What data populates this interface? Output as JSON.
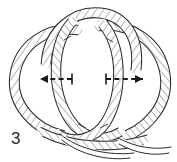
{
  "figure": {
    "kind": "line-drawing-illustration",
    "step_number": "3",
    "background_color": "#ffffff",
    "ink_color": "#2b2b2b",
    "rope_fill_color": "#ffffff",
    "rope_hatch_color": "#6f6f6f",
    "canvas": {
      "width": 177,
      "height": 162
    }
  },
  "arrows": [
    {
      "name": "left-pull-arrow",
      "direction": "left",
      "style": "dashed",
      "color": "#1a1a1a",
      "tail_x": 72,
      "tail_y": 79,
      "tip_x": 31,
      "tip_y": 79
    },
    {
      "name": "right-pull-arrow",
      "direction": "right",
      "style": "dashed",
      "color": "#1a1a1a",
      "tail_x": 106,
      "tail_y": 79,
      "tip_x": 152,
      "tip_y": 79
    }
  ],
  "ropes": [
    {
      "name": "left-outer-loop",
      "description": "large left-hand rope loop"
    },
    {
      "name": "right-outer-loop",
      "description": "large right-hand rope loop"
    },
    {
      "name": "upper-crossing-bight",
      "description": "upper rope arc crossing over both loops"
    },
    {
      "name": "inner-center-loop",
      "description": "central rope loop passing through"
    },
    {
      "name": "bottom-crossing-strands",
      "description": "lower rope strands crossing and tucking"
    }
  ]
}
